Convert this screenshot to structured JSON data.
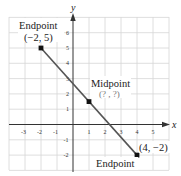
{
  "diagram": {
    "type": "coordinate-plane-midpoint",
    "axes": {
      "x_label": "x",
      "y_label": "y",
      "x_ticks": [
        "-3",
        "-2",
        "-1",
        "1",
        "2",
        "3",
        "4",
        "5"
      ],
      "y_ticks": [
        "6",
        "5",
        "4",
        "3",
        "2",
        "1",
        "-1",
        "-2"
      ]
    },
    "points": {
      "endpoint1": {
        "title": "Endpoint",
        "coords": "(−2, 5)"
      },
      "midpoint": {
        "title": "Midpoint",
        "coords": "(? , ?)"
      },
      "endpoint2": {
        "title": "Endpoint",
        "coords": "(4, −2)"
      }
    },
    "colors": {
      "grid": "#d4d4d4",
      "axis": "#333333",
      "segment": "#555555",
      "point": "#111111"
    }
  }
}
